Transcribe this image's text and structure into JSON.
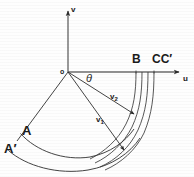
{
  "figure": {
    "type": "geometry-diagram",
    "background_color": "#fefefe",
    "stroke_color": "#2b2b2b",
    "label_color": "#1b1b1b"
  },
  "axes": {
    "vertical": {
      "label": "v",
      "arrow": "up",
      "x": 68,
      "y_top": 8,
      "y_bottom": 72
    },
    "horizontal": {
      "label": "u",
      "arrow": "right",
      "y": 72,
      "x_left": 68,
      "x_right": 184
    },
    "origin": {
      "label": "o",
      "x": 68,
      "y": 72
    }
  },
  "angle": {
    "label": "θ",
    "x": 86,
    "y": 76
  },
  "points": [
    {
      "name": "point-A",
      "label": "A",
      "x": 22,
      "y": 130
    },
    {
      "name": "point-A-prime",
      "label": "A′",
      "x": 5,
      "y": 148
    },
    {
      "name": "point-B",
      "label": "B",
      "x": 133,
      "y": 58
    },
    {
      "name": "point-CC-prime",
      "label": "CC′",
      "x": 152,
      "y": 58
    }
  ],
  "velocity_vectors": [
    {
      "name": "velocity-v2",
      "label": "v",
      "subscript": "2",
      "x": 110,
      "y": 96
    },
    {
      "name": "velocity-v1",
      "label": "v",
      "subscript": "1",
      "x": 96,
      "y": 119
    }
  ],
  "geometry": {
    "rays": [
      {
        "id": "ray-to-A",
        "from": [
          68,
          72
        ],
        "to": [
          18,
          140
        ]
      },
      {
        "id": "ray-to-v1",
        "from": [
          68,
          72
        ],
        "to": [
          123,
          149
        ]
      },
      {
        "id": "ray-to-v2",
        "from": [
          68,
          72
        ],
        "to": [
          133,
          113
        ]
      }
    ],
    "arcs": [
      {
        "id": "outer-arc",
        "radius": 94,
        "note": "passes through A′"
      },
      {
        "id": "inner-arc",
        "radius": 82,
        "note": "passes through A"
      }
    ],
    "blade_channel_lines": 4,
    "blade_top_x": [
      136,
      142,
      148,
      154
    ]
  }
}
